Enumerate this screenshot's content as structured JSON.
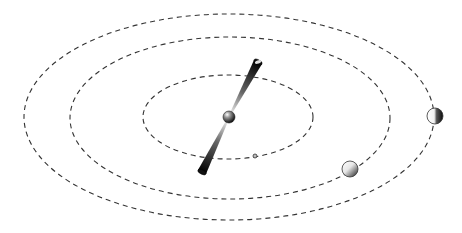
{
  "diagram": {
    "type": "orbital-system",
    "canvas": {
      "width": 462,
      "height": 233,
      "background": "#ffffff"
    },
    "orbits": [
      {
        "name": "outer-orbit",
        "cx": 229,
        "cy": 117,
        "rx": 205,
        "ry": 103,
        "stroke": "#333333",
        "dash": "5,4"
      },
      {
        "name": "middle-orbit",
        "cx": 230,
        "cy": 118,
        "rx": 160,
        "ry": 81,
        "stroke": "#333333",
        "dash": "5,4"
      },
      {
        "name": "inner-orbit",
        "cx": 228,
        "cy": 117,
        "rx": 85,
        "ry": 42,
        "stroke": "#333333",
        "dash": "5,4"
      }
    ],
    "central_body": {
      "name": "central-sphere",
      "cx": 229,
      "cy": 117,
      "r": 6
    },
    "jet": {
      "top": {
        "x": 258,
        "y": 62
      },
      "bottom": {
        "x": 202,
        "y": 172
      }
    },
    "bodies": [
      {
        "name": "small-moon",
        "cx": 255,
        "cy": 156,
        "r": 2
      },
      {
        "name": "planet-middle-orbit",
        "cx": 350,
        "cy": 169,
        "r": 8
      },
      {
        "name": "planet-outer-orbit",
        "cx": 435,
        "cy": 116,
        "r": 8
      }
    ]
  }
}
